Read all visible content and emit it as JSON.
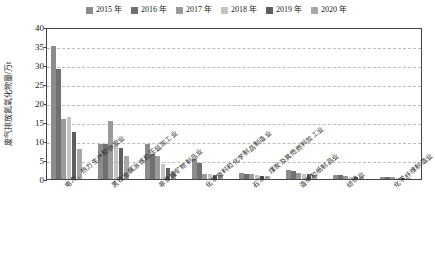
{
  "chart_data": {
    "type": "bar",
    "title": "",
    "xlabel": "",
    "ylabel": "废气排放氮氧化物量/万t",
    "ylim": [
      0,
      40
    ],
    "ytick_step": 5,
    "yticks": [
      "0",
      "5",
      "10",
      "15",
      "20",
      "25",
      "30",
      "35",
      "40"
    ],
    "grid": true,
    "legend_position": "top-center",
    "categories": [
      "电力、热力生产和供应业",
      "黑色金属冶炼和压延加工业",
      "非金属矿物制品业",
      "化学原料和化学制品制造业",
      "石油、煤炭及其他燃料加工业",
      "造纸和纸制品业",
      "纺织业",
      "化学纤维制造业"
    ],
    "series": [
      {
        "name": "2015 年",
        "color": "#8c8c8c",
        "values": [
          35.0,
          9.3,
          9.2,
          5.3,
          1.5,
          2.3,
          1.1,
          0.5
        ]
      },
      {
        "name": "2016 年",
        "color": "#707070",
        "values": [
          28.9,
          9.3,
          6.6,
          4.2,
          1.4,
          2.2,
          1.0,
          0.5
        ]
      },
      {
        "name": "2017 年",
        "color": "#9a9a9a",
        "values": [
          15.9,
          15.3,
          6.1,
          1.3,
          1.2,
          1.5,
          0.8,
          0.4
        ]
      },
      {
        "name": "2018 年",
        "color": "#c4c4c4",
        "values": [
          16.3,
          9.8,
          3.9,
          1.2,
          1.0,
          1.3,
          0.6,
          0.3
        ]
      },
      {
        "name": "2019 年",
        "color": "#5f5f5f",
        "values": [
          12.4,
          8.2,
          3.0,
          1.1,
          0.9,
          1.2,
          0.6,
          0.3
        ]
      },
      {
        "name": "2020 年",
        "color": "#a8a8a8",
        "values": [
          7.8,
          6.0,
          2.0,
          1.0,
          0.8,
          1.0,
          0.5,
          0.3
        ]
      }
    ]
  },
  "legend": {
    "items": [
      {
        "label": "2015 年",
        "color": "#8c8c8c"
      },
      {
        "label": "2016 年",
        "color": "#707070"
      },
      {
        "label": "2017 年",
        "color": "#9a9a9a"
      },
      {
        "label": "2018 年",
        "color": "#c4c4c4"
      },
      {
        "label": "2019 年",
        "color": "#5f5f5f"
      },
      {
        "label": "2020 年",
        "color": "#a8a8a8"
      }
    ]
  },
  "style": {
    "axis_color": "#444444",
    "grid_color": "#bdbdbd",
    "background": "#ffffff"
  }
}
